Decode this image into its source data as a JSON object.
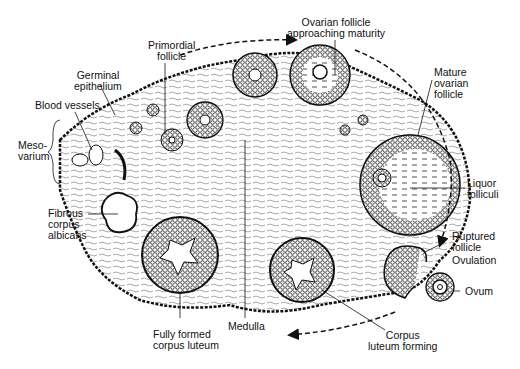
{
  "diagram": {
    "labels": {
      "primordial_follicle": "Primordial\nfollicle",
      "germinal_epithelium": "Germinal\nepithelium",
      "blood_vessels": "Blood vessels",
      "mesovarium": "Meso-\nvarium",
      "ovarian_follicle_approaching_maturity": "Ovarian follicle\napproaching maturity",
      "mature_ovarian_follicle": "Mature\novarian\nfollicle",
      "liquor_folliculi": "Liquor\nfolliculi",
      "ruptured_follicle": "Ruptured\nfollicle",
      "ovulation": "Ovulation",
      "ovum": "Ovum",
      "fibrous_corpus_albicans": "Fibrous\ncorpus\nalbicans",
      "fully_formed_corpus_luteum": "Fully formed\ncorpus luteum",
      "medulla": "Medulla",
      "corpus_luteum_forming": "Corpus\nluteum forming"
    },
    "colors": {
      "ink": "#111111",
      "background": "#ffffff"
    }
  }
}
